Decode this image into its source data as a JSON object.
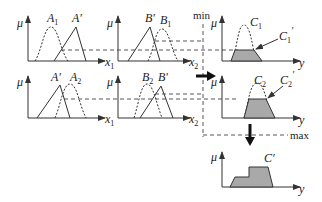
{
  "diagram": {
    "axis_labels": {
      "mu": "μ",
      "x1": "x",
      "x1_sub": "1",
      "x2": "x",
      "x2_sub": "2",
      "y": "y"
    },
    "rule1": {
      "input1_set": "A",
      "input1_sub": "1",
      "input1_fact": "A′",
      "input2_fact": "B′",
      "input2_set": "B",
      "input2_sub": "1",
      "output_set": "C",
      "output_sub": "1",
      "output_clipped": "C",
      "output_clipped_sub": "1",
      "output_clipped_prime": "′"
    },
    "rule2": {
      "input1_fact": "A′",
      "input1_set": "A",
      "input1_sub": "2",
      "input2_set": "B",
      "input2_sub": "2",
      "input2_fact": "B′",
      "output_set": "C",
      "output_sub": "2",
      "output_clipped": "C",
      "output_clipped_sub": "2",
      "output_clipped_prime": "′"
    },
    "operators": {
      "min": "min",
      "max": "max"
    },
    "result": {
      "output_label": "C′"
    },
    "colors": {
      "fill": "#a9a9a9",
      "stroke": "#333333"
    }
  }
}
